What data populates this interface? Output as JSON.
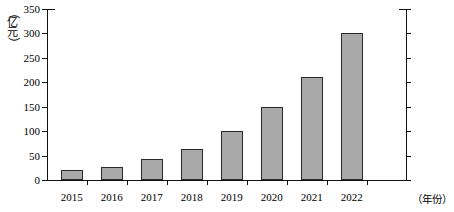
{
  "chart_data": {
    "type": "bar",
    "title": "",
    "xlabel": "（年份）",
    "ylabel": "（亿元）",
    "categories": [
      "2015",
      "2016",
      "2017",
      "2018",
      "2019",
      "2020",
      "2021",
      "2022"
    ],
    "values": [
      20,
      27,
      42,
      63,
      100,
      150,
      210,
      300
    ],
    "ylim": [
      0,
      350
    ],
    "ytick_labels": [
      "0",
      "50",
      "100",
      "150",
      "200",
      "250",
      "300",
      "350"
    ],
    "ytick_values": [
      0,
      50,
      100,
      150,
      200,
      250,
      300,
      350
    ],
    "grid": false,
    "legend": "none",
    "bar_fill_color": "#a9a9a9",
    "bar_border_color": "#2b2b2b",
    "axis_color": "#111111"
  },
  "axis_label_vertical_chars": [
    "（",
    "亿",
    "元",
    "）"
  ]
}
